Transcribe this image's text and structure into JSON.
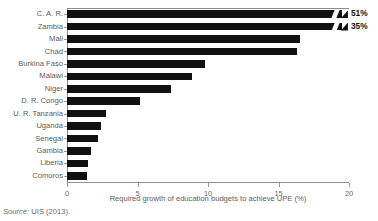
{
  "chart_data": {
    "type": "bar",
    "orientation": "horizontal",
    "title": "",
    "subtitle": "",
    "xlabel": "Required growth of education budgets to achieve UPE (%)",
    "ylabel": "",
    "xlim": [
      0,
      20
    ],
    "xticks": [
      0,
      5,
      10,
      15,
      20
    ],
    "xticklabels": [
      "0",
      "5",
      "10",
      "15",
      "20"
    ],
    "grid": false,
    "legend": null,
    "axis_break": {
      "present": true,
      "note": "Top two bars are truncated at the axis edge and annotated with their true values",
      "truncated_at": 19.5,
      "bars": [
        "C. A. R.",
        "Zambia"
      ]
    },
    "categories": [
      "C. A. R.",
      "Zambia",
      "Mali",
      "Chad",
      "Burkina Faso",
      "Malawi",
      "Niger",
      "D. R. Congo",
      "U. R. Tanzania",
      "Uganda",
      "Senegal",
      "Gambia",
      "Liberia",
      "Comoros"
    ],
    "values": [
      51,
      35,
      16.5,
      16.3,
      9.8,
      8.9,
      7.4,
      5.2,
      2.8,
      2.4,
      2.2,
      1.7,
      1.5,
      1.4
    ],
    "plotted_values": [
      19.5,
      19.5,
      16.5,
      16.3,
      9.8,
      8.9,
      7.4,
      5.2,
      2.8,
      2.4,
      2.2,
      1.7,
      1.5,
      1.4
    ],
    "data_labels": [
      "51%",
      "35%",
      "",
      "",
      "",
      "",
      "",
      "",
      "",
      "",
      "",
      "",
      "",
      ""
    ],
    "bar_color": "#111111",
    "axis_color": "#8d8d8d",
    "label_color": "#5c5c5c"
  },
  "source": {
    "prefix": "Source:",
    "body": " UIS (2013)."
  }
}
